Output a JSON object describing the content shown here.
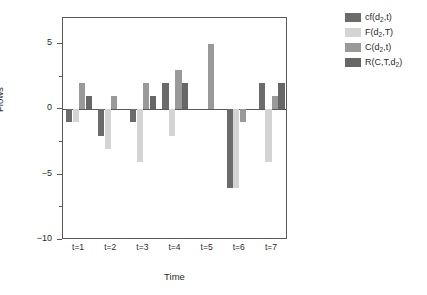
{
  "chart_data": {
    "type": "bar",
    "title": "",
    "subtitle": "",
    "xlabel": "Time",
    "ylabel": "Flows",
    "categories": [
      "t=1",
      "t=2",
      "t=3",
      "t=4",
      "t=5",
      "t=6",
      "t=7"
    ],
    "ylim": [
      -10,
      7
    ],
    "yticks": [
      5,
      0,
      -5,
      -10
    ],
    "ytick_labels": [
      "5",
      "0",
      "−5",
      "−10"
    ],
    "yticks_minor": [
      2.5,
      -2.5,
      -7.5
    ],
    "grid": false,
    "legend_position": "top-right",
    "series": [
      {
        "name": "cf(d2,t)",
        "label_main": "cf(d",
        "label_sub": "2",
        "label_tail": ",t)",
        "color": "#6b6b6b",
        "values": [
          -1,
          -2,
          -1,
          2,
          null,
          -6,
          2
        ]
      },
      {
        "name": "F(d2,T)",
        "label_main": "F(d",
        "label_sub": "2",
        "label_tail": ",T)",
        "color": "#d4d4d4",
        "values": [
          -1,
          -3,
          -4,
          -2,
          null,
          -6,
          -4
        ]
      },
      {
        "name": "C(d2,t)",
        "label_main": "C(d",
        "label_sub": "2",
        "label_tail": ",t)",
        "color": "#999999",
        "values": [
          2,
          1,
          2,
          3,
          5,
          -1,
          1
        ]
      },
      {
        "name": "R(C,T,d2)",
        "label_main": "R(C,T,d",
        "label_sub": "2",
        "label_tail": ")",
        "color": "#676767",
        "values": [
          1,
          null,
          1,
          2,
          null,
          null,
          2
        ]
      }
    ]
  },
  "axes": {
    "frame_color": "#5a5a5a",
    "text_color": "#2b2b2b"
  }
}
